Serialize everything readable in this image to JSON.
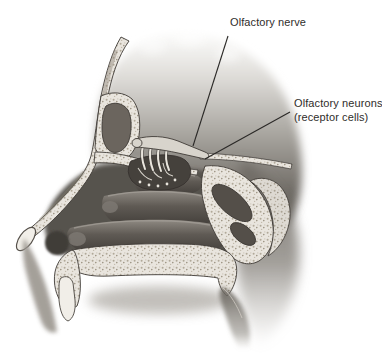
{
  "figure": {
    "background_color": "#ffffff",
    "label_color": "#2f2d2b",
    "leader_line_color": "#2b2927",
    "bone_color": "#e9e5de",
    "cavity_color": "#57524d",
    "annotations": {
      "olfactory_nerve": {
        "label": "Olfactory nerve"
      },
      "olfactory_neurons": {
        "line1": "Olfactory neurons",
        "line2": "(receptor cells)"
      }
    }
  }
}
